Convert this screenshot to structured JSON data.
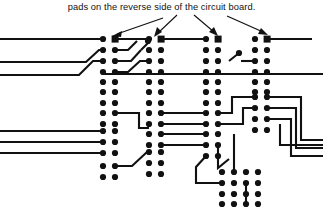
{
  "figure": {
    "type": "pcb-layout-diagram",
    "caption": "pads on the reverse side of the circuit board.",
    "colors": {
      "ink": "#111111",
      "background": "#ffffff",
      "pad": "#111111",
      "trace": "#111111"
    },
    "canvas": {
      "width": 323,
      "height": 208
    }
  },
  "annotations": {
    "arrows": [
      {
        "name": "arrow-to-pad-group-1",
        "from": [
          163,
          18
        ],
        "to": [
          110,
          38
        ],
        "target": "square-pad-group-1"
      },
      {
        "name": "arrow-to-pad-group-2",
        "from": [
          176,
          16
        ],
        "to": [
          152,
          38
        ],
        "target": "square-pad-group-2"
      },
      {
        "name": "arrow-to-pad-group-3",
        "from": [
          196,
          16
        ],
        "to": [
          213,
          37
        ],
        "target": "square-pad-group-3"
      },
      {
        "name": "arrow-to-pad-group-4",
        "from": [
          228,
          17
        ],
        "to": [
          262,
          37
        ],
        "target": "square-pad-group-4"
      }
    ]
  },
  "pad_groups": [
    {
      "name": "pad-group-1",
      "columns_x": [
        103,
        115
      ],
      "first_row_y": 39,
      "row_pitch": 10.6,
      "rows": 14,
      "square_pad": {
        "col": 1,
        "row": 0,
        "size": 7
      }
    },
    {
      "name": "pad-group-2",
      "columns_x": [
        149,
        161
      ],
      "first_row_y": 39,
      "row_pitch": 10.6,
      "rows": 14,
      "square_pad": {
        "col": 1,
        "row": 0,
        "size": 7
      }
    },
    {
      "name": "pad-group-3",
      "columns_x": [
        206,
        218
      ],
      "first_row_y": 39,
      "row_pitch": 10.6,
      "rows": 11,
      "square_pad": {
        "col": 1,
        "row": 0,
        "size": 7
      }
    },
    {
      "name": "pad-group-4",
      "columns_x": [
        255,
        267
      ],
      "first_row_y": 39,
      "row_pitch": 10.6,
      "rows": 9,
      "square_pad": {
        "col": 1,
        "row": 0,
        "size": 7
      }
    },
    {
      "name": "pad-group-bottom-grid",
      "columns_x": [
        222,
        234,
        246,
        258
      ],
      "first_row_y": 172,
      "row_pitch": 10.6,
      "rows": 4,
      "square_pad": null
    },
    {
      "name": "pad-pair-right-lower",
      "columns_x": [
        255,
        267
      ],
      "first_row_y": 122,
      "row_pitch": 10.6,
      "rows": 2,
      "square_pad": null
    }
  ],
  "traces": {
    "count": 22,
    "description": "copper traces routed between pads",
    "paths": [
      "M0,39 L103,39",
      "M0,61 L88,61 L99,50 L103,50",
      "M0,73 L82,73 L95,60 L103,60",
      "M0,131 L103,131",
      "M0,142 L103,142",
      "M0,153 L103,153",
      "M103,74 L323,74",
      "M115,39 L149,39",
      "M149,39 L140,48 L132,48",
      "M115,60 L126,60 L137,49",
      "M115,71 L130,71 L141,60 L149,60",
      "M115,113 L140,113 L140,128 L161,128",
      "M115,166 L132,166 L146,152 L161,152",
      "M161,39 L206,39",
      "M161,118 L206,118",
      "M161,128 L206,128",
      "M161,139 L196,139 L206,139",
      "M218,118 L230,118 L230,100 L255,100",
      "M218,128 L245,128 L245,112 L255,112",
      "M218,139 L218,170 L228,160",
      "M206,150 L196,160 L196,183 L222,183",
      "M267,39 L310,39",
      "M267,103 L300,103 L300,140 L323,140",
      "M267,114 L295,114 L295,148 L323,148",
      "M267,125 L290,125 L290,156 L323,156",
      "M234,130 L234,172",
      "M246,183 L246,205"
    ]
  }
}
